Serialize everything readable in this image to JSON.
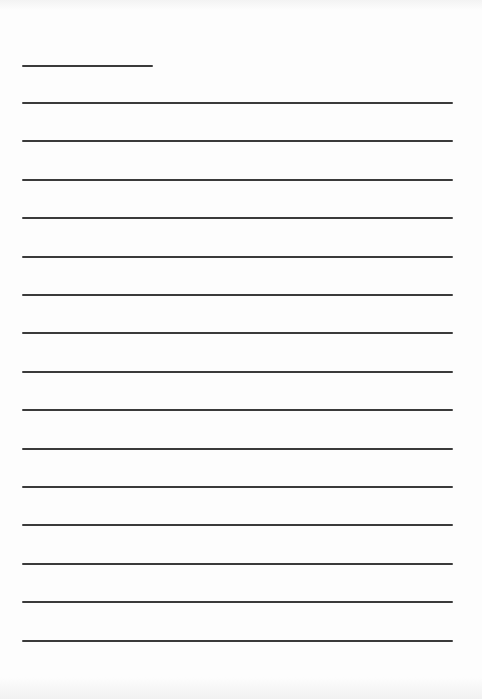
{
  "document": {
    "type": "blank lined paper",
    "short_rule": {
      "x": 22,
      "y": 65,
      "width": 131
    },
    "full_rules": {
      "count": 15,
      "x_start": 22,
      "x_end": 453,
      "first_y": 102,
      "spacing": 38.4
    },
    "colors": {
      "paper": "#fdfdfd",
      "ink": "#2a2a2a"
    }
  }
}
